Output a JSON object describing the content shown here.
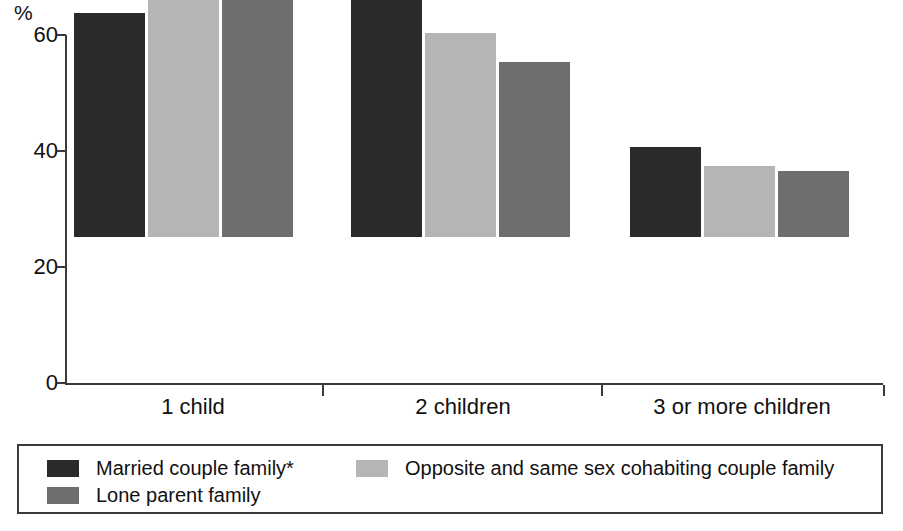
{
  "axis": {
    "y_unit": "%",
    "y_ticks": [
      "0",
      "20",
      "40",
      "60"
    ],
    "y_min": 0,
    "y_max": 60
  },
  "legend": {
    "entries": [
      {
        "label": "Married couple family*",
        "color": "#2a2a2a"
      },
      {
        "label": "Opposite and same sex cohabiting couple family",
        "color": "#b5b5b5"
      },
      {
        "label": "Lone parent family",
        "color": "#6e6e6e"
      }
    ]
  },
  "chart_data": {
    "type": "bar",
    "title": "",
    "subtitle": "",
    "xlabel": "",
    "ylabel": "%",
    "ylim": [
      0,
      60
    ],
    "yticks": [
      0,
      20,
      40,
      60
    ],
    "grid": false,
    "legend_position": "bottom",
    "categories": [
      "1 child",
      "2 children",
      "3 or more children"
    ],
    "series": [
      {
        "name": "Married couple family*",
        "color": "#2a2a2a",
        "values": [
          38.6,
          44.5,
          15.5
        ]
      },
      {
        "name": "Opposite and same sex cohabiting couple family",
        "color": "#b5b5b5",
        "values": [
          49.3,
          35.2,
          12.3
        ]
      },
      {
        "name": "Lone parent family",
        "color": "#6e6e6e",
        "values": [
          56.2,
          30.2,
          11.3
        ]
      }
    ]
  },
  "layout": {
    "plot_left_px": 67,
    "plot_right_px": 883,
    "baseline_y_px": 383,
    "top_y_px": 35,
    "group_starts_px": [
      74,
      351,
      630
    ],
    "bar_width_px": 71,
    "bar_gap_px": 3,
    "group_tick_px": [
      322,
      601
    ],
    "cat_label_centers_px": [
      193,
      463,
      742
    ]
  }
}
